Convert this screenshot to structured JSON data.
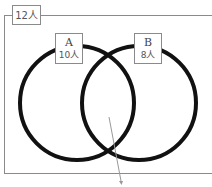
{
  "diagram": {
    "type": "venn",
    "total_label": "12人",
    "sets": [
      {
        "name": "A",
        "count_label": "10人"
      },
      {
        "name": "B",
        "count_label": "8人"
      }
    ],
    "colors": {
      "circle_stroke": "#111111",
      "frame": "#8a8a8a",
      "label_text": "#555555",
      "arrow": "#999999"
    },
    "annotation": {
      "target": "A∩B",
      "kind": "arrow-pointer"
    }
  }
}
